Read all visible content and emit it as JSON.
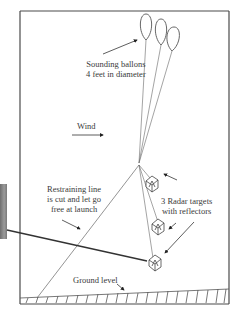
{
  "diagram": {
    "type": "illustration",
    "labels": {
      "balloons": [
        "Sounding ballons",
        "4 feet in diameter"
      ],
      "wind": "Wind",
      "restraining": [
        "Restraining line",
        "is cut and let go",
        "free at launch"
      ],
      "radar": [
        "3 Radar targets",
        "with reflectors"
      ],
      "ground": "Ground level"
    },
    "counts": {
      "balloons": 3,
      "radar_targets": 3
    },
    "colors": {
      "line": "#555555",
      "frame": "#4a4a4a",
      "text": "#3a3a3a",
      "pointer": "#222222"
    }
  }
}
